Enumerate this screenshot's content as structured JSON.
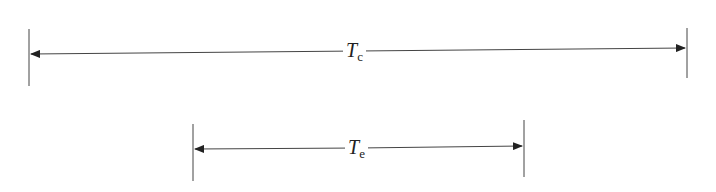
{
  "diagram": {
    "intervals": [
      {
        "id": "tc",
        "symbol": "T",
        "subscript": "c",
        "x_start": 29,
        "x_end": 687
      },
      {
        "id": "te",
        "symbol": "T",
        "subscript": "e",
        "x_start": 193,
        "x_end": 524
      }
    ],
    "line_color": "#333333"
  }
}
